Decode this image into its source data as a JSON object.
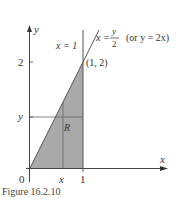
{
  "figure": {
    "caption": "Figure 16.2.10",
    "axes": {
      "x_label": "x",
      "y_label": "y",
      "origin_label": "0"
    },
    "ticks": {
      "x_tick_label": "1",
      "y_tick_label": "2",
      "x_var_label": "x",
      "y_var_label": "y"
    },
    "curves": {
      "vertical_line_label": "x = 1",
      "slant_line_lhs": "x =",
      "slant_line_num": "y",
      "slant_line_den": "2",
      "slant_line_alt": "(or y = 2x)"
    },
    "point_label": "(1, 2)",
    "region_label": "R",
    "colors": {
      "shade": "#a8a8a8",
      "line": "#555555",
      "axis": "#444444"
    }
  }
}
